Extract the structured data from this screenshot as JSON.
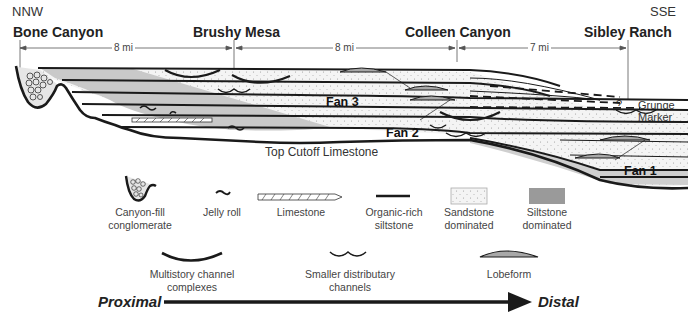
{
  "directions": {
    "left": "NNW",
    "right": "SSE"
  },
  "locations": [
    {
      "name": "Bone Canyon"
    },
    {
      "name": "Brushy Mesa"
    },
    {
      "name": "Colleen Canyon"
    },
    {
      "name": "Sibley Ranch"
    }
  ],
  "distances": [
    "8 mi",
    "8 mi",
    "7 mi"
  ],
  "units": {
    "fan3": "Fan 3",
    "fan2": "Fan 2",
    "fan1": "Fan 1",
    "top_cutoff": "Top Cutoff Limestone",
    "grunge_marker": [
      "Grunge",
      "Marker"
    ],
    "uncertain": "?"
  },
  "legend": {
    "row1": [
      {
        "icon": "canyon-fill-icon",
        "label": [
          "Canyon-fill",
          "conglomerate"
        ]
      },
      {
        "icon": "jelly-roll-icon",
        "label": [
          "Jelly roll"
        ]
      },
      {
        "icon": "limestone-icon",
        "label": [
          "Limestone"
        ]
      },
      {
        "icon": "organic-siltstone-icon",
        "label": [
          "Organic-rich",
          "siltstone"
        ]
      },
      {
        "icon": "sandstone-swatch-icon",
        "label": [
          "Sandstone",
          "dominated"
        ]
      },
      {
        "icon": "siltstone-swatch-icon",
        "label": [
          "Siltstone",
          "dominated"
        ]
      }
    ],
    "row2": [
      {
        "icon": "multistory-channel-icon",
        "label": [
          "Multistory channel",
          "complexes"
        ]
      },
      {
        "icon": "distributary-channel-icon",
        "label": [
          "Smaller distributary",
          "channels"
        ]
      },
      {
        "icon": "lobeform-icon",
        "label": [
          "Lobeform"
        ]
      }
    ]
  },
  "axis": {
    "start": "Proximal",
    "end": "Distal"
  },
  "colors": {
    "sandstone": "#f2f2f2",
    "siltstone_light": "#c8c8c8",
    "siltstone_dark": "#9a9a9a",
    "line": "#1a1a1a"
  }
}
